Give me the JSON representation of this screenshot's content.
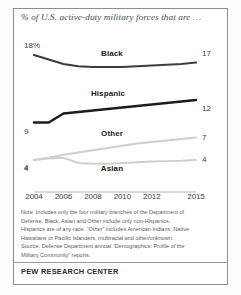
{
  "chart_data": {
    "type": "line",
    "title": "% of U.S. active-duty military forces that are …",
    "xlabel": "",
    "ylabel": "",
    "x": [
      2004,
      2005,
      2006,
      2007,
      2008,
      2009,
      2010,
      2011,
      2012,
      2013,
      2014,
      2015
    ],
    "tick_labels": [
      "2004",
      "2006",
      "2008",
      "2010",
      "2012",
      "2015"
    ],
    "tick_values": [
      2004,
      2006,
      2008,
      2010,
      2012,
      2015
    ],
    "ylim": [
      0,
      20
    ],
    "xlim": [
      2004,
      2015
    ],
    "grid": false,
    "legend_position": "inline-labels",
    "series": [
      {
        "name": "Black",
        "color": "#3d3d3d",
        "start_value": "18%",
        "end_value": "17",
        "values": [
          18.0,
          17.4,
          16.8,
          16.5,
          16.4,
          16.4,
          16.4,
          16.5,
          16.6,
          16.7,
          16.8,
          17.0
        ]
      },
      {
        "name": "Hispanic",
        "color": "#1c1c1c",
        "start_value": "9",
        "end_value": "12",
        "values": [
          9.0,
          9.0,
          10.2,
          10.4,
          10.6,
          10.8,
          11.0,
          11.2,
          11.4,
          11.6,
          11.8,
          12.0
        ]
      },
      {
        "name": "Other",
        "color": "#cfcfcf",
        "start_value": "4",
        "end_value": "7",
        "values": [
          4.0,
          4.3,
          4.7,
          5.0,
          5.3,
          5.6,
          5.9,
          6.2,
          6.4,
          6.6,
          6.8,
          7.0
        ]
      },
      {
        "name": "Asian",
        "color": "#cfcfcf",
        "start_value": "4",
        "end_value": "4",
        "values": [
          4.0,
          4.2,
          4.3,
          3.6,
          3.5,
          3.5,
          3.6,
          3.7,
          3.8,
          3.85,
          3.9,
          4.0
        ]
      }
    ],
    "notes": [
      "Note: Includes only the four military branches of the Department of",
      "Defense. Black, Asian and Other include only non-Hispanics.",
      "Hispanics are of any race. “Other” includes American Indians, Native",
      "Hawaiians or Pacific Islanders, multiracial and other/unknown.",
      "Source: Defense Department annual “Demographics: Profile of the",
      "Military Community” reports."
    ],
    "footer": "PEW RESEARCH CENTER"
  }
}
